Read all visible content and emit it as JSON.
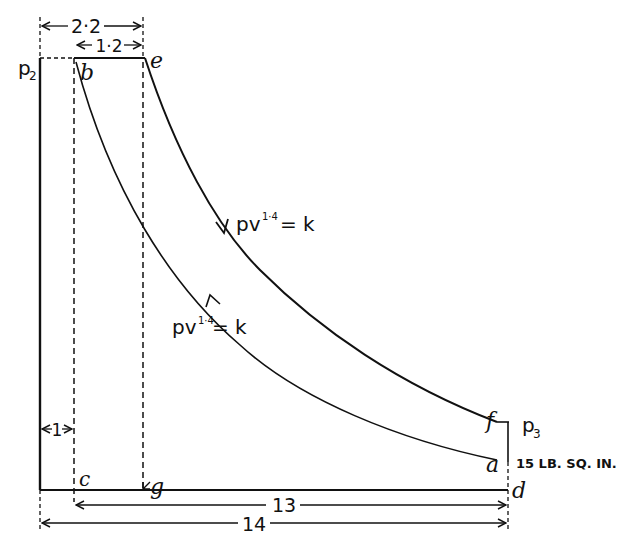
{
  "diagram": {
    "type": "pressure-volume (p-v) indicator diagram",
    "points": {
      "b": "b",
      "e": "e",
      "f": "f",
      "a": "a",
      "c": "c",
      "g": "g",
      "d": "d"
    },
    "pressure_labels": {
      "p2": "p",
      "p2_sub": "2",
      "p3": "p",
      "p3_sub": "3",
      "low_pressure": "15 LB. SQ. IN."
    },
    "curves": {
      "expansion": {
        "label_base": "pv",
        "label_exp": "1·4",
        "label_rhs": "= k",
        "direction": "down (e to f)"
      },
      "compression": {
        "label_base": "pv",
        "label_exp": "1·4",
        "label_rhs": "= k",
        "direction": "up (a to b)"
      }
    },
    "dimensions": {
      "top_outer": "2·2",
      "top_inner": "1·2",
      "left_clearance": "1",
      "bottom_inner": "13",
      "bottom_outer": "14"
    },
    "colors": {
      "ink": "#111111",
      "paper": "#ffffff"
    }
  }
}
